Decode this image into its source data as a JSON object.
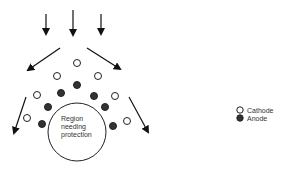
{
  "diagram": {
    "center_label": [
      "Region",
      "needing",
      "protection"
    ],
    "legend": {
      "cathode": "Cathode",
      "anode": "Anode"
    },
    "colors": {
      "stroke": "#222222",
      "anode_fill": "#333333",
      "cathode_fill": "#ffffff"
    }
  }
}
